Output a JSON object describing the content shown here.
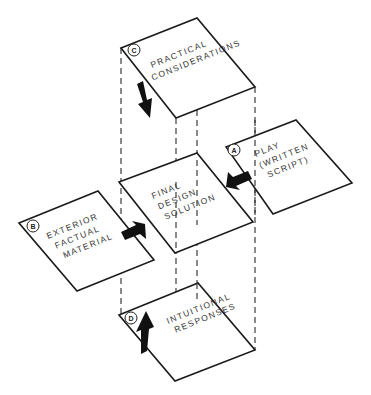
{
  "diagram": {
    "type": "isometric-flow",
    "colors": {
      "line": "#1a1a1a",
      "arrow": "#111111",
      "background": "#ffffff",
      "text": "#333333"
    },
    "center": {
      "label_lines": [
        "FINAL",
        "DESIGN",
        "SOLUTION"
      ]
    },
    "inputs": [
      {
        "id": "A",
        "badge": "A",
        "label_lines": [
          "PLAY",
          "(WRITTEN",
          "SCRIPT)"
        ],
        "position": "right",
        "arrow_direction": "left"
      },
      {
        "id": "B",
        "badge": "B",
        "label_lines": [
          "EXTERIOR",
          "FACTUAL",
          "MATERIAL"
        ],
        "position": "left",
        "arrow_direction": "right"
      },
      {
        "id": "C",
        "badge": "C",
        "label_lines": [
          "PRACTICAL",
          "CONSIDERATIONS"
        ],
        "position": "top",
        "arrow_direction": "down"
      },
      {
        "id": "D",
        "badge": "D",
        "label_lines": [
          "INTUITIONAL",
          "RESPONSES"
        ],
        "position": "bottom",
        "arrow_direction": "up"
      }
    ]
  }
}
